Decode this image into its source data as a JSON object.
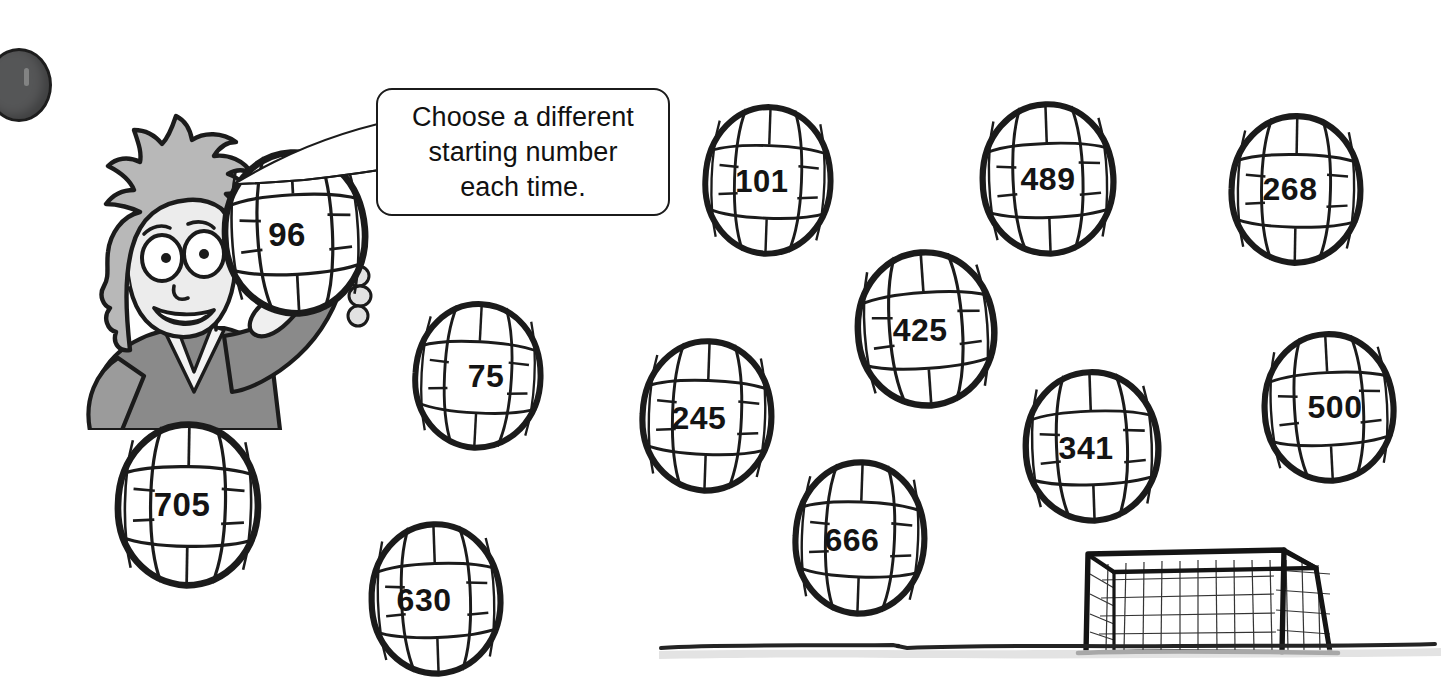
{
  "page": {
    "background_color": "#ffffff",
    "ink_color": "#1b1b1b",
    "type": "illustration"
  },
  "speech_bubble": {
    "name": "speech-bubble",
    "line1": "Choose a different",
    "line2": "starting number",
    "line3": "each time.",
    "full_text": "Choose a different starting number each time."
  },
  "character": {
    "name": "cartoon-boy",
    "description": "smiling boy with spiky hair holding a volleyball",
    "hair_color": "#b8b8b8",
    "skin_color": "#e9e9e9",
    "shirt_color": "#7d7d7d"
  },
  "balls": [
    {
      "id": "ball-96",
      "number": "96",
      "left": 219,
      "top": 148,
      "width": 152,
      "height": 170,
      "font_size": 33,
      "num_dx": -8,
      "num_dy": 2,
      "rotate": -3
    },
    {
      "id": "ball-101",
      "number": "101",
      "left": 700,
      "top": 103,
      "width": 136,
      "height": 155,
      "font_size": 31,
      "num_dx": -6,
      "num_dy": 1,
      "rotate": 2
    },
    {
      "id": "ball-489",
      "number": "489",
      "left": 977,
      "top": 100,
      "width": 142,
      "height": 158,
      "font_size": 32,
      "num_dx": 0,
      "num_dy": 0,
      "rotate": -2
    },
    {
      "id": "ball-268",
      "number": "268",
      "left": 1226,
      "top": 112,
      "width": 140,
      "height": 155,
      "font_size": 32,
      "num_dx": -6,
      "num_dy": 0,
      "rotate": 1
    },
    {
      "id": "ball-425",
      "number": "425",
      "left": 852,
      "top": 248,
      "width": 148,
      "height": 162,
      "font_size": 32,
      "num_dx": -6,
      "num_dy": 1,
      "rotate": -4
    },
    {
      "id": "ball-75",
      "number": "75",
      "left": 410,
      "top": 300,
      "width": 136,
      "height": 152,
      "font_size": 32,
      "num_dx": 8,
      "num_dy": 0,
      "rotate": 3
    },
    {
      "id": "ball-245",
      "number": "245",
      "left": 637,
      "top": 337,
      "width": 140,
      "height": 158,
      "font_size": 32,
      "num_dx": -8,
      "num_dy": 2,
      "rotate": 2
    },
    {
      "id": "ball-341",
      "number": "341",
      "left": 1020,
      "top": 368,
      "width": 144,
      "height": 157,
      "font_size": 32,
      "num_dx": -6,
      "num_dy": 2,
      "rotate": -2
    },
    {
      "id": "ball-500",
      "number": "500",
      "left": 1259,
      "top": 330,
      "width": 140,
      "height": 155,
      "font_size": 32,
      "num_dx": 6,
      "num_dy": 0,
      "rotate": -3
    },
    {
      "id": "ball-705",
      "number": "705",
      "left": 112,
      "top": 420,
      "width": 152,
      "height": 170,
      "font_size": 33,
      "num_dx": -6,
      "num_dy": 0,
      "rotate": 1
    },
    {
      "id": "ball-666",
      "number": "666",
      "left": 790,
      "top": 458,
      "width": 140,
      "height": 160,
      "font_size": 32,
      "num_dx": -8,
      "num_dy": 2,
      "rotate": 2
    },
    {
      "id": "ball-630",
      "number": "630",
      "left": 366,
      "top": 520,
      "width": 140,
      "height": 158,
      "font_size": 32,
      "num_dx": -12,
      "num_dy": 1,
      "rotate": -2
    }
  ],
  "ball_numbers": [
    "96",
    "101",
    "489",
    "268",
    "425",
    "75",
    "245",
    "341",
    "500",
    "705",
    "666",
    "630"
  ],
  "goal": {
    "name": "soccer-goal",
    "description": "hand-drawn soccer goal with net"
  },
  "ground": {
    "name": "ground-line",
    "description": "hand-drawn horizontal ground line with grey shading"
  },
  "corner_mark": {
    "name": "page-corner-dot",
    "description": "dark grey circular scan artefact at top-left edge"
  }
}
